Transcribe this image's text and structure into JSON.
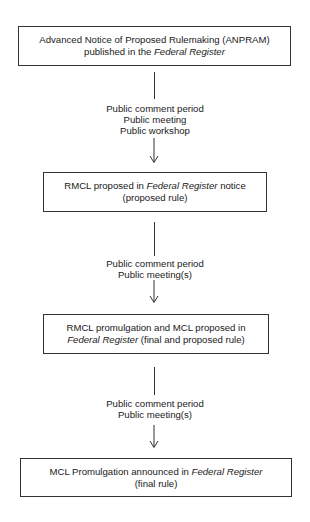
{
  "diagram": {
    "type": "flowchart",
    "steps": [
      {
        "line1_pre": "Advanced Notice of Proposed Rulemaking (ANPRAM)",
        "line2_pre": "published in the ",
        "line2_italic": "Federal Register"
      },
      {
        "line1_pre": "RMCL proposed in ",
        "line1_italic": "Federal Register",
        "line1_post": " notice",
        "line2": "(proposed rule)"
      },
      {
        "line1": "RMCL promulgation and MCL proposed in",
        "line2_italic": "Federal Register",
        "line2_post": " (final and proposed rule)"
      },
      {
        "line1_pre": "MCL Promulgation announced in ",
        "line1_italic": "Federal Register",
        "line2": "(final rule)"
      }
    ],
    "transitions": [
      {
        "items": [
          "Public comment period",
          "Public meeting",
          "Public workshop"
        ]
      },
      {
        "items": [
          "Public comment period",
          "Public meeting(s)"
        ]
      },
      {
        "items": [
          "Public comment period",
          "Public meeting(s)"
        ]
      }
    ],
    "colors": {
      "stroke": "#333333",
      "text": "#1a1a1a",
      "background": "#ffffff"
    }
  }
}
